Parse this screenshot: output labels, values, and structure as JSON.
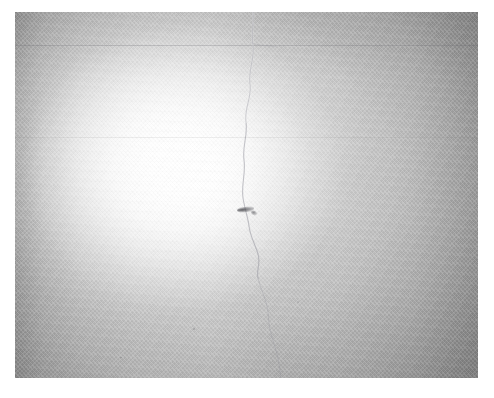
{
  "image": {
    "kind": "photograph",
    "subject": "close-up of a white painted textured wall surface",
    "caption": "White textured wall with bright illuminated highlight, a vertical hairline crack and a small dark blemish",
    "width": 494,
    "height": 398,
    "orientation": "landscape"
  },
  "frame": {
    "background_color": "#ffffff",
    "margin_left": 15,
    "margin_top": 12,
    "margin_right": 16,
    "margin_bottom": 20,
    "plate_width": 463,
    "plate_height": 366
  },
  "tones": {
    "highlight_color": "#ffffff",
    "midtone_color": "#d2d2d2",
    "edge_gray": "#adadad",
    "corner_gray": "#a5a5a5",
    "crack_color": "#9a9aa0",
    "blemish_color": "#4a4a4f"
  },
  "features": [
    {
      "name": "illumination-hotspot",
      "label": "Bright highlight",
      "shape": "ellipse",
      "center_x_pct": 38,
      "center_y_pct": 44,
      "color": "#ffffff"
    },
    {
      "name": "vertical-crack",
      "label": "Vertical hairline crack",
      "orientation": "vertical",
      "from_y": 14,
      "to_y": 360,
      "approx_x": 250,
      "color": "#9a9aa0"
    },
    {
      "name": "horizontal-seam",
      "label": "Horizontal seam",
      "orientation": "horizontal",
      "approx_y": 45,
      "color": "#78787d"
    },
    {
      "name": "dark-blemish",
      "label": "Small dark mark",
      "approx_x": 237,
      "approx_y": 209,
      "color": "#4a4a4f"
    },
    {
      "name": "surface-weave",
      "label": "Fine diagonal weave texture",
      "angle_deg": 48,
      "color": "#c8c8c8"
    },
    {
      "name": "corner-vignette",
      "label": "Corner vignetting",
      "strength_pct": 15,
      "color": "#000000"
    }
  ]
}
